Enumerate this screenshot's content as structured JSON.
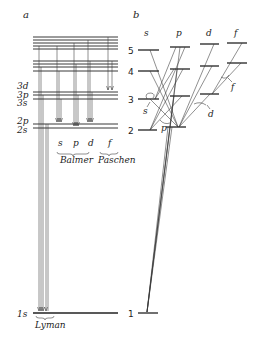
{
  "panel_a": {
    "label": "a",
    "levels": [
      "3d",
      "3p",
      "3s",
      "2p",
      "2s",
      "1s"
    ],
    "series_columns": [
      "s",
      "p",
      "d",
      "f"
    ],
    "series": [
      "Balmer",
      "Paschen",
      "Lyman"
    ]
  },
  "panel_b": {
    "label": "b",
    "columns": [
      "s",
      "p",
      "d",
      "f"
    ],
    "levels": [
      "5",
      "4",
      "3",
      "2",
      "1"
    ],
    "transition_labels": [
      "s",
      "p",
      "d",
      "f"
    ]
  }
}
